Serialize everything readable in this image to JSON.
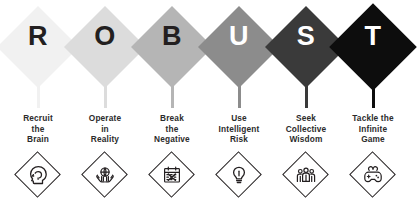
{
  "acronym": {
    "word": "ROBUST",
    "pillars": [
      {
        "letter": "R",
        "diamond_color": "#f1f1f1",
        "letter_color": "#231f20",
        "label_line1": "Recruit",
        "label_line2": "the",
        "label_line3": "Brain",
        "icon": "head-profile-icon"
      },
      {
        "letter": "O",
        "diamond_color": "#dcdcdc",
        "letter_color": "#231f20",
        "label_line1": "Operate",
        "label_line2": "in",
        "label_line3": "Reality",
        "icon": "hands-holding-globe-icon"
      },
      {
        "letter": "B",
        "diamond_color": "#b5b5b5",
        "letter_color": "#231f20",
        "label_line1": "Break",
        "label_line2": "the",
        "label_line3": "Negative",
        "icon": "calendar-cross-icon"
      },
      {
        "letter": "U",
        "diamond_color": "#8c8c8c",
        "letter_color": "#ffffff",
        "label_line1": "Use",
        "label_line2": "Intelligent",
        "label_line3": "Risk",
        "icon": "lightbulb-icon"
      },
      {
        "letter": "S",
        "diamond_color": "#3a3a3a",
        "letter_color": "#ffffff",
        "label_line1": "Seek",
        "label_line2": "Collective",
        "label_line3": "Wisdom",
        "icon": "group-of-people-icon"
      },
      {
        "letter": "T",
        "diamond_color": "#0d0d0d",
        "letter_color": "#ffffff",
        "label_line1": "Tackle the",
        "label_line2": "Infinite",
        "label_line3": "Game",
        "icon": "game-controller-icon"
      }
    ]
  },
  "theme": {
    "background": "#ffffff",
    "text_color": "#2b2b2b",
    "icon_stroke": "#231f20"
  }
}
